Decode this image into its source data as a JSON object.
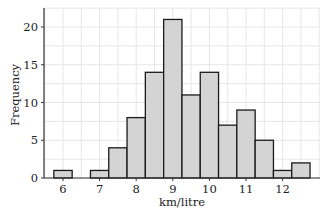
{
  "chart_data": {
    "type": "bar",
    "subtype": "histogram",
    "title": "",
    "xlabel": "km/litre",
    "ylabel": "Frequency",
    "bin_width": 0.5,
    "bins": [
      {
        "start": 5.75,
        "end": 6.25,
        "count": 1
      },
      {
        "start": 6.25,
        "end": 6.75,
        "count": 0
      },
      {
        "start": 6.75,
        "end": 7.25,
        "count": 1
      },
      {
        "start": 7.25,
        "end": 7.75,
        "count": 4
      },
      {
        "start": 7.75,
        "end": 8.25,
        "count": 8
      },
      {
        "start": 8.25,
        "end": 8.75,
        "count": 14
      },
      {
        "start": 8.75,
        "end": 9.25,
        "count": 21
      },
      {
        "start": 9.25,
        "end": 9.75,
        "count": 11
      },
      {
        "start": 9.75,
        "end": 10.25,
        "count": 14
      },
      {
        "start": 10.25,
        "end": 10.75,
        "count": 7
      },
      {
        "start": 10.75,
        "end": 11.25,
        "count": 9
      },
      {
        "start": 11.25,
        "end": 11.75,
        "count": 5
      },
      {
        "start": 11.75,
        "end": 12.25,
        "count": 1
      },
      {
        "start": 12.25,
        "end": 12.75,
        "count": 2
      }
    ],
    "categories": [
      "6",
      "6.5",
      "7",
      "7.5",
      "8",
      "8.5",
      "9",
      "9.5",
      "10",
      "10.5",
      "11",
      "11.5",
      "12",
      "12.5"
    ],
    "values": [
      1,
      0,
      1,
      4,
      8,
      14,
      21,
      11,
      14,
      7,
      9,
      5,
      1,
      2
    ],
    "x_ticks": [
      "6",
      "7",
      "8",
      "9",
      "10",
      "11",
      "12"
    ],
    "y_ticks": [
      "0",
      "5",
      "10",
      "15",
      "20"
    ],
    "xlim": [
      5.5,
      13.0
    ],
    "ylim": [
      0,
      22.5
    ],
    "grid": true,
    "legend": null,
    "colors": {
      "bar_fill": "#d4d4d4",
      "bar_edge": "#1a1a1a",
      "grid": "#e6e6e6",
      "axis": "#333333"
    }
  }
}
